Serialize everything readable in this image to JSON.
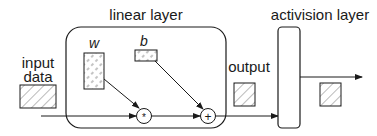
{
  "diagram": {
    "linear_layer": {
      "label": "linear layer",
      "weight_label": "w",
      "bias_label": "b",
      "multiply_op": "*",
      "add_op": "+"
    },
    "activation_layer": {
      "label": "activision layer"
    },
    "input": {
      "label_line1": "input",
      "label_line2": "data"
    },
    "output": {
      "label": "output"
    },
    "colors": {
      "stroke": "#1a1a1a",
      "hatch": "#a9a9a9",
      "background": "#ffffff"
    }
  }
}
